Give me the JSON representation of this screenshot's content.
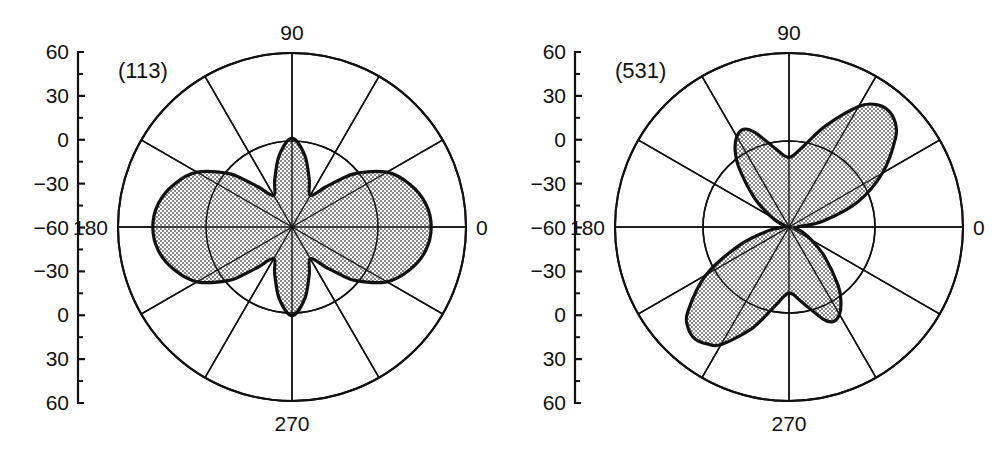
{
  "figure": {
    "type": "polar-rose-diagram-pair",
    "width": 994,
    "height": 461,
    "background": "#ffffff",
    "line_color": "#111111",
    "fill_color": "#b8b8b8",
    "fill_pattern": "fine-dot-stipple"
  },
  "chart_data": [
    {
      "type": "line",
      "subtype": "polar",
      "title": "(113)",
      "xlabel": "",
      "ylabel": "",
      "grid": true,
      "legend": null,
      "angle_unit": "degrees",
      "angle_labels": [
        "90",
        "180",
        "0",
        "270"
      ],
      "angle_label_positions": [
        90,
        180,
        0,
        270
      ],
      "radial_spokes_deg": [
        0,
        30,
        60,
        90,
        120,
        150,
        180,
        210,
        240,
        270,
        300,
        330
      ],
      "radial_rings": [
        0.5,
        1.0
      ],
      "rlim": [
        0,
        1
      ],
      "left_axis_ticks": [
        "60",
        "30",
        "0",
        "-30",
        "-60",
        "-30",
        "0",
        "30",
        "60"
      ],
      "left_axis_tick_values": [
        60,
        30,
        0,
        -30,
        -60,
        -30,
        0,
        30,
        60
      ],
      "left_axis_minor_ticks_per_interval": 1,
      "series": [
        {
          "name": "(113) pole figure intensity",
          "theta": [
            0,
            10,
            20,
            30,
            40,
            45,
            50,
            60,
            70,
            80,
            90,
            100,
            110,
            120,
            130,
            135,
            140,
            150,
            160,
            170,
            180,
            190,
            200,
            210,
            220,
            225,
            230,
            240,
            250,
            260,
            270,
            280,
            290,
            300,
            310,
            315,
            320,
            330,
            340,
            350
          ],
          "r": [
            0.8,
            0.78,
            0.72,
            0.63,
            0.48,
            0.38,
            0.3,
            0.21,
            0.29,
            0.42,
            0.51,
            0.42,
            0.29,
            0.21,
            0.3,
            0.38,
            0.48,
            0.63,
            0.72,
            0.78,
            0.8,
            0.78,
            0.72,
            0.63,
            0.48,
            0.38,
            0.3,
            0.21,
            0.29,
            0.42,
            0.51,
            0.42,
            0.29,
            0.21,
            0.3,
            0.38,
            0.48,
            0.63,
            0.72,
            0.78
          ]
        }
      ]
    },
    {
      "type": "line",
      "subtype": "polar",
      "title": "(531)",
      "xlabel": "",
      "ylabel": "",
      "grid": true,
      "legend": null,
      "angle_unit": "degrees",
      "angle_labels": [
        "90",
        "180",
        "0",
        "270"
      ],
      "angle_label_positions": [
        90,
        180,
        0,
        270
      ],
      "radial_spokes_deg": [
        0,
        30,
        60,
        90,
        120,
        150,
        180,
        210,
        240,
        270,
        300,
        330
      ],
      "radial_rings": [
        0.5,
        1.0
      ],
      "rlim": [
        0,
        1
      ],
      "left_axis_ticks": [
        "60",
        "30",
        "0",
        "-30",
        "-60",
        "-30",
        "0",
        "30",
        "60"
      ],
      "left_axis_tick_values": [
        60,
        30,
        0,
        -30,
        -60,
        -30,
        0,
        30,
        60
      ],
      "left_axis_minor_ticks_per_interval": 1,
      "series": [
        {
          "name": "(531) pole figure intensity",
          "theta": [
            0,
            10,
            20,
            30,
            40,
            45,
            50,
            55,
            60,
            70,
            80,
            90,
            100,
            110,
            115,
            120,
            125,
            130,
            140,
            150,
            160,
            170,
            180,
            190,
            200,
            210,
            220,
            225,
            230,
            235,
            240,
            250,
            260,
            270,
            280,
            290,
            295,
            300,
            305,
            310,
            320,
            330,
            340,
            350
          ],
          "r": [
            0.05,
            0.2,
            0.42,
            0.62,
            0.8,
            0.86,
            0.88,
            0.86,
            0.8,
            0.62,
            0.47,
            0.4,
            0.46,
            0.58,
            0.62,
            0.6,
            0.54,
            0.45,
            0.26,
            0.12,
            0.05,
            0.03,
            0.03,
            0.12,
            0.3,
            0.55,
            0.76,
            0.82,
            0.84,
            0.82,
            0.78,
            0.62,
            0.46,
            0.38,
            0.44,
            0.56,
            0.6,
            0.58,
            0.52,
            0.44,
            0.27,
            0.15,
            0.08,
            0.04
          ]
        }
      ]
    }
  ],
  "panels": [
    {
      "id": "(113)",
      "angle_labels": {
        "top": "90",
        "left": "180",
        "right": "0",
        "bottom": "270"
      },
      "axis_ticks": [
        "60",
        "30",
        "0",
        "-30",
        "-60",
        "-30",
        "0",
        "30",
        "60"
      ]
    },
    {
      "id": "(531)",
      "angle_labels": {
        "top": "90",
        "left": "180",
        "right": "0",
        "bottom": "270"
      },
      "axis_ticks": [
        "60",
        "30",
        "0",
        "-30",
        "-60",
        "-30",
        "0",
        "30",
        "60"
      ]
    }
  ]
}
